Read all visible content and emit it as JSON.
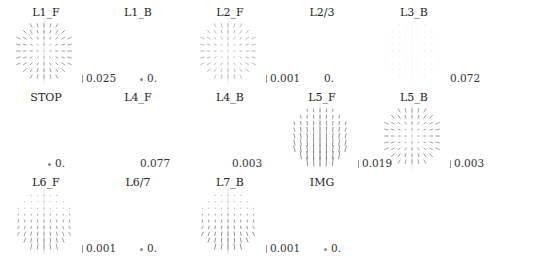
{
  "chart_data": {
    "type": "vector-field-grid",
    "title": "",
    "layout": {
      "rows": 3,
      "cols": 6
    },
    "panels": [
      {
        "id": "L1_F",
        "title": "L1_F",
        "scale_label": "0.025",
        "row": 0,
        "col": 0,
        "has_field": true,
        "pattern": "radial",
        "color": "#888888"
      },
      {
        "id": "L1_B",
        "title": "L1_B",
        "scale_label": "0.",
        "row": 0,
        "col": 1,
        "has_field": false,
        "pattern": "none",
        "color": "#888888"
      },
      {
        "id": "L2_F",
        "title": "L2_F",
        "scale_label": "0.001",
        "row": 0,
        "col": 2,
        "has_field": true,
        "pattern": "radial",
        "color": "#aaaaaa"
      },
      {
        "id": "L2/3",
        "title": "L2/3",
        "scale_label": "0.",
        "row": 0,
        "col": 3,
        "has_field": false,
        "pattern": "none",
        "color": "#888888"
      },
      {
        "id": "L3_B",
        "title": "L3_B",
        "scale_label": "0.072",
        "row": 0,
        "col": 4,
        "has_field": true,
        "pattern": "faint-vertical",
        "color": "#eeeeee"
      },
      {
        "id": "STOP",
        "title": "STOP",
        "scale_label": "0.",
        "row": 1,
        "col": 0,
        "has_field": false,
        "pattern": "none",
        "color": "#888888"
      },
      {
        "id": "L4_F",
        "title": "L4_F",
        "scale_label": "0.077",
        "row": 1,
        "col": 1,
        "has_field": false,
        "pattern": "none",
        "color": "#888888"
      },
      {
        "id": "L4_B",
        "title": "L4_B",
        "scale_label": "0.003",
        "row": 1,
        "col": 2,
        "has_field": false,
        "pattern": "none",
        "color": "#888888"
      },
      {
        "id": "L5_F",
        "title": "L5_F",
        "scale_label": "0.019",
        "row": 1,
        "col": 3,
        "has_field": true,
        "pattern": "vertical-shear",
        "color": "#777777"
      },
      {
        "id": "L5_B",
        "title": "L5_B",
        "scale_label": "0.003",
        "row": 1,
        "col": 4,
        "has_field": true,
        "pattern": "radial",
        "color": "#888888"
      },
      {
        "id": "L6_F",
        "title": "L6_F",
        "scale_label": "0.001",
        "row": 2,
        "col": 0,
        "has_field": true,
        "pattern": "converge-bottom",
        "color": "#888888"
      },
      {
        "id": "L6/7",
        "title": "L6/7",
        "scale_label": "0.",
        "row": 2,
        "col": 1,
        "has_field": false,
        "pattern": "none",
        "color": "#888888"
      },
      {
        "id": "L7_B",
        "title": "L7_B",
        "scale_label": "0.001",
        "row": 2,
        "col": 2,
        "has_field": true,
        "pattern": "converge-bottom",
        "color": "#777777"
      },
      {
        "id": "IMG",
        "title": "IMG",
        "scale_label": "0.",
        "row": 2,
        "col": 3,
        "has_field": false,
        "pattern": "none",
        "color": "#888888"
      }
    ]
  }
}
